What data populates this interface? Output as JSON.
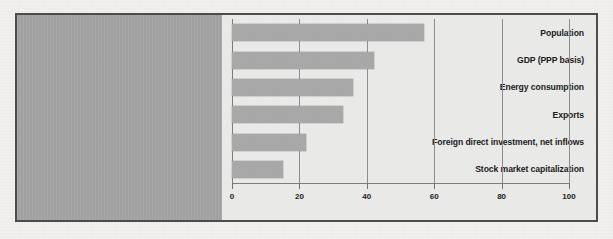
{
  "chart_data": {
    "type": "bar",
    "orientation": "horizontal",
    "title": "",
    "subtitle": "",
    "xlabel": "",
    "ylabel": "",
    "categories": [
      "Population",
      "GDP (PPP basis)",
      "Energy consumption",
      "Exports",
      "Foreign direct investment, net inflows",
      "Stock market capitalization"
    ],
    "values": [
      57,
      42,
      36,
      33,
      22,
      15
    ],
    "xlim": [
      0,
      100
    ],
    "xticks": [
      0,
      20,
      40,
      60,
      80,
      100
    ],
    "xtick_labels": [
      "0",
      "20",
      "40",
      "60",
      "80",
      "100"
    ],
    "grid": "vertical",
    "legend": "none",
    "series": [
      {
        "name": "share",
        "values": [
          57,
          42,
          36,
          33,
          22,
          15
        ]
      }
    ],
    "colors": {
      "bar": "#a8a8a8",
      "plot_background": "#e9e9e7",
      "label_panel": "#a6a6a6",
      "frame": "#4c4c4c",
      "text": "#1b1b1b",
      "gridline": "#8d8d8d",
      "page_background": "#f1f0ee"
    }
  }
}
